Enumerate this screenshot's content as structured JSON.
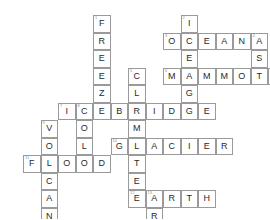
{
  "puzzle": {
    "title": "Climate Crossword",
    "grid": {
      "origin_x": 23,
      "origin_y": 15,
      "cell_size": 17.5,
      "cols": 15,
      "rows": 13
    },
    "colors": {
      "cell_border": "#9a9a9a",
      "letter": "#2a2a2a",
      "clue_number": "#8d8d8d",
      "background": "#ffffff"
    },
    "entries": [
      {
        "number": "1",
        "answer": "FREEZE",
        "direction": "down",
        "row": 0,
        "col": 4
      },
      {
        "number": "2",
        "answer": "ICEAGE",
        "direction": "down",
        "row": 0,
        "col": 9
      },
      {
        "number": "3",
        "answer": "OCEAN",
        "direction": "across",
        "row": 1,
        "col": 8
      },
      {
        "number": "4",
        "answer": "ASH",
        "direction": "down",
        "row": 1,
        "col": 13
      },
      {
        "number": "5",
        "answer": "CLIMATE",
        "direction": "down",
        "row": 3,
        "col": 6
      },
      {
        "number": "6",
        "answer": "MAMMOTH",
        "direction": "across",
        "row": 3,
        "col": 8
      },
      {
        "number": "7",
        "answer": "ICEBRIDGE",
        "direction": "across",
        "row": 5,
        "col": 2
      },
      {
        "number": "8",
        "answer": "COLD",
        "direction": "down",
        "row": 5,
        "col": 3
      },
      {
        "number": "9",
        "answer": "VOLCANO",
        "direction": "down",
        "row": 6,
        "col": 1
      },
      {
        "number": "10",
        "answer": "GLACIER",
        "direction": "across",
        "row": 7,
        "col": 5
      },
      {
        "number": "11",
        "answer": "FLOOD",
        "direction": "across",
        "row": 8,
        "col": 0
      },
      {
        "number": "12",
        "answer": "EARTH",
        "direction": "across",
        "row": 10,
        "col": 6
      },
      {
        "number": "13",
        "answer": "ARK",
        "direction": "down",
        "row": 10,
        "col": 7
      }
    ]
  }
}
